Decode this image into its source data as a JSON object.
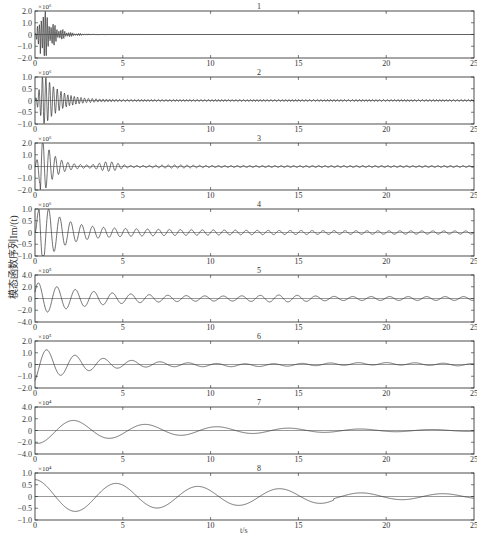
{
  "chart_data": {
    "type": "line",
    "title": "",
    "xlabel": "t/s",
    "ylabel": "模态函数序列Im/(t)",
    "x_range": [
      0,
      25
    ],
    "x_ticks": [
      0,
      5,
      10,
      15,
      20,
      25
    ],
    "grid": false,
    "legend": null,
    "panels": [
      {
        "label": "1",
        "scale": "×10⁶",
        "yticks": [
          "2.0",
          "1.0",
          "0",
          "-1.0",
          "-2.0"
        ],
        "ylim": [
          -2.0,
          2.0
        ],
        "description": "high-frequency burst 0-2 s, peak ~1.5, decays near 0 by ~5 s"
      },
      {
        "label": "2",
        "scale": "×10⁶",
        "yticks": [
          "1.0",
          "0.5",
          "0",
          "-0.5",
          "-1.0"
        ],
        "ylim": [
          -1.0,
          1.0
        ],
        "description": "burst peak ~0.9 near 1 s, decaying oscillation to ~5 s, small ripple afterward"
      },
      {
        "label": "3",
        "scale": "×10⁶",
        "yticks": [
          "2.0",
          "1.0",
          "0",
          "-1.0",
          "-2.0"
        ],
        "ylim": [
          -2.0,
          2.0
        ],
        "description": "oscillation peak ~1.2 near 0.8 s, wave packet near 4 s, small ripple thereafter"
      },
      {
        "label": "4",
        "scale": "×10⁶",
        "yticks": [
          "1.0",
          "0.5",
          "0",
          "-0.5",
          "-1.0"
        ],
        "ylim": [
          -1.0,
          1.0
        ],
        "description": "damped oscillation peak ~0.8 near 1 s, amplitude ~0.2 to ~8 s, small ripples to 25 s"
      },
      {
        "label": "5",
        "scale": "×10⁵",
        "yticks": [
          "4.0",
          "2.0",
          "0",
          "-2.0",
          "-4.0"
        ],
        "ylim": [
          -4.0,
          4.0
        ],
        "description": "oscillation peak ~2.6 near 0.8 s, ~2.0 near 3 s, decaying to ~0.5 ripple"
      },
      {
        "label": "6",
        "scale": "×10⁵",
        "yticks": [
          "2.0",
          "1.0",
          "0",
          "-1.0",
          "-2.0"
        ],
        "ylim": [
          -2.0,
          2.0
        ],
        "description": "low-frequency oscillation, min ~-1.5 at 0.3 s, peak ~1.3 at 1.2 s, decaying to near 0 by 8 s"
      },
      {
        "label": "7",
        "scale": "×10⁴",
        "yticks": [
          "4.0",
          "2.0",
          "0",
          "-2.0",
          "-4.0"
        ],
        "ylim": [
          -4.0,
          4.0
        ],
        "description": "slow oscillation ~2.0 amplitude, period ~4 s, peaks at 1.3, 3.4, 7 s, decaying to 0 by 15 s"
      },
      {
        "label": "8",
        "scale": "×10⁴",
        "yticks": [
          "1.0",
          "0.5",
          "0",
          "-0.5",
          "-1.0"
        ],
        "ylim": [
          -1.0,
          1.0
        ],
        "description": "slowest oscillation ~0.7 amplitude, period ~5 s, peaks at 0, 4.5, 9, 14, 19 s, decaying"
      }
    ]
  },
  "axes": {
    "xlabel": "t/s",
    "ylabel": "模态函数序列Im/(t)",
    "xtick_labels": [
      "0",
      "5",
      "10",
      "15",
      "20",
      "25"
    ]
  },
  "colors": {
    "line": "#333333",
    "axis": "#222222",
    "text": "#333333"
  }
}
